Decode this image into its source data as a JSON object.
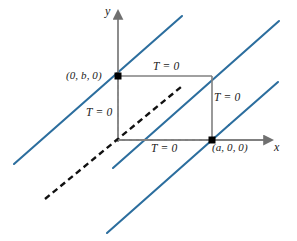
{
  "figure": {
    "background_color": "#ffffff",
    "width": 297,
    "height": 241,
    "colors": {
      "line_blue": "#2c6e9e",
      "axis_gray": "#808080",
      "dashed_black": "#111111",
      "text": "#1a1a1a",
      "point_black": "#000000"
    }
  },
  "axes": {
    "y_axis_label": "y",
    "x_axis_label": "x",
    "origin": {
      "x": 118,
      "y": 140
    }
  },
  "points": [
    {
      "name": "point-0-b-0",
      "label": "(0, b, 0)",
      "label_x": 66,
      "label_y": 70,
      "marker_x": 118,
      "marker_y": 76
    },
    {
      "name": "point-a-0-0",
      "label": "(a, 0, 0)",
      "label_x": 211,
      "label_y": 142,
      "marker_x": 212,
      "marker_y": 140
    }
  ],
  "boundary_labels": [
    {
      "name": "boundary-label-left",
      "text": "T = 0",
      "x": 86,
      "y": 107
    },
    {
      "name": "boundary-label-top",
      "text": "T = 0",
      "x": 153,
      "y": 61
    },
    {
      "name": "boundary-label-right",
      "text": "T = 0",
      "x": 214,
      "y": 92
    },
    {
      "name": "boundary-label-bottom",
      "text": "T = 0",
      "x": 151,
      "y": 143
    }
  ],
  "blue_lines": [
    {
      "name": "blue-line-1",
      "x1": 14,
      "y1": 164,
      "x2": 182,
      "y2": 16
    },
    {
      "name": "blue-line-2",
      "x1": 113,
      "y1": 168,
      "x2": 279,
      "y2": 21
    },
    {
      "name": "blue-line-3",
      "x1": 107,
      "y1": 233,
      "x2": 229,
      "y2": 125
    },
    {
      "name": "blue-line-4",
      "x1": 229,
      "y1": 125,
      "x2": 278,
      "y2": 82
    }
  ],
  "solid_edges": [
    {
      "name": "edge-top",
      "x1": 118,
      "y1": 76,
      "x2": 212,
      "y2": 76
    },
    {
      "name": "edge-right",
      "x1": 212,
      "y1": 76,
      "x2": 212,
      "y2": 140
    }
  ],
  "dashed_edges": [
    {
      "name": "dashed-edge-left",
      "x1": 118,
      "y1": 76,
      "x2": 118,
      "y2": 140
    },
    {
      "name": "dashed-edge-bottom",
      "x1": 118,
      "y1": 140,
      "x2": 212,
      "y2": 140
    }
  ],
  "dashed_z_axis": {
    "name": "dashed-z-axis",
    "x1": 45,
    "y1": 199,
    "x2": 181,
    "y2": 87
  },
  "axis_lines": {
    "y_axis": {
      "x1": 118,
      "y1": 142,
      "x2": 118,
      "y2": 16
    },
    "x_axis": {
      "x1": 118,
      "y1": 140,
      "x2": 268,
      "y2": 140
    }
  },
  "axis_label_positions": {
    "y": {
      "x": 106,
      "y": 6
    },
    "x": {
      "x": 274,
      "y": 142
    }
  }
}
